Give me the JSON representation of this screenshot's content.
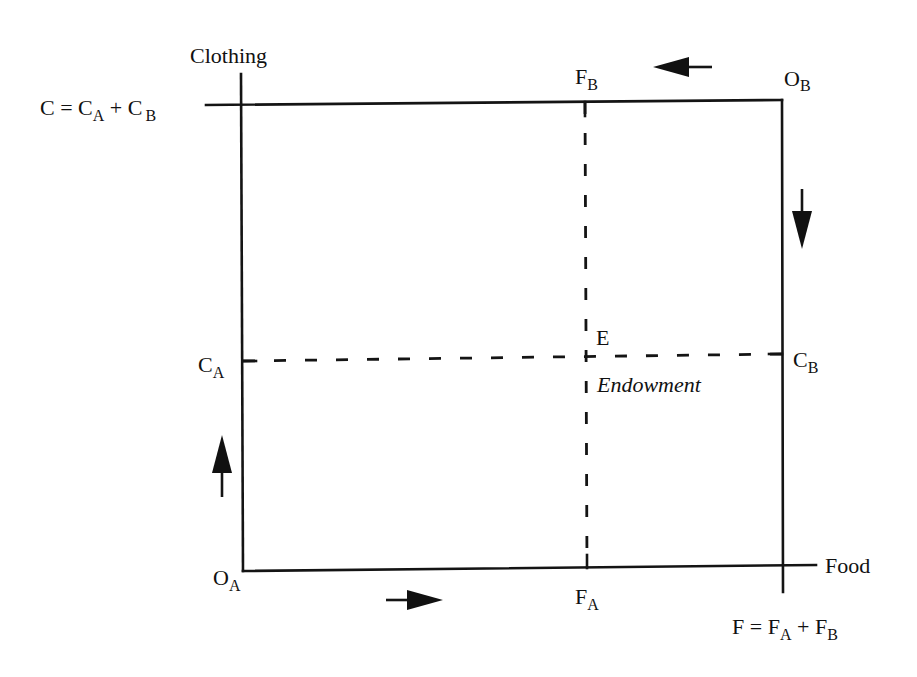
{
  "diagram": {
    "type": "edgeworth-box",
    "colors": {
      "ink": "#141414",
      "background": "#ffffff"
    },
    "axes": {
      "vertical_axis_label": "Clothing",
      "horizontal_axis_label": "Food"
    },
    "origins": {
      "consumer_a": {
        "main": "O",
        "sub": "A"
      },
      "consumer_b": {
        "main": "O",
        "sub": "B"
      }
    },
    "totals": {
      "clothing": {
        "lhs": "C",
        "eq": " = ",
        "t1": "C",
        "t1_sub": "A",
        "plus": " + ",
        "t2": "C",
        "t2_sub": "B"
      },
      "food": {
        "lhs": "F",
        "eq": " = ",
        "t1": "F",
        "t1_sub": "A",
        "plus": " + ",
        "t2": "F",
        "t2_sub": "B"
      }
    },
    "allocations": {
      "food_a": {
        "main": "F",
        "sub": "A"
      },
      "food_b": {
        "main": "F",
        "sub": "B"
      },
      "clothing_a": {
        "main": "C",
        "sub": "A"
      },
      "clothing_b": {
        "main": "C",
        "sub": "B"
      }
    },
    "endowment_point": {
      "label": "E",
      "caption": "Endowment"
    },
    "direction_arrows": [
      {
        "name": "consumer-a-clothing-increase",
        "direction": "up"
      },
      {
        "name": "consumer-a-food-increase",
        "direction": "right"
      },
      {
        "name": "consumer-b-food-increase",
        "direction": "left"
      },
      {
        "name": "consumer-b-clothing-increase",
        "direction": "down"
      }
    ]
  }
}
